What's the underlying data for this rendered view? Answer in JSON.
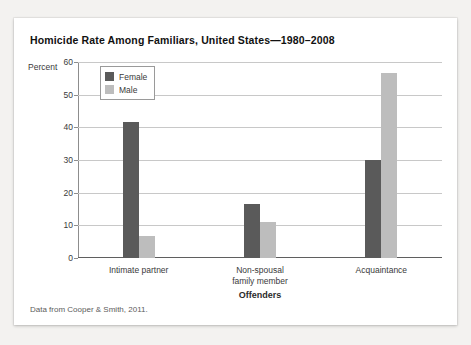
{
  "card": {
    "title": "Homicide Rate Among Familiars, United States—1980–2008",
    "source_note": "Data from Cooper & Smith, 2011."
  },
  "colors": {
    "female_bar": "#5a5a5a",
    "male_bar": "#bdbdbd",
    "gridline": "#c8c8c8",
    "axis": "#5f5f5f",
    "card_background": "#ffffff",
    "page_background": "#f3f2f0"
  },
  "legend": {
    "position": "top-left-inside-plot",
    "entries": [
      {
        "label": "Female",
        "swatch": "#5a5a5a"
      },
      {
        "label": "Male",
        "swatch": "#bdbdbd"
      }
    ]
  },
  "chart_data": {
    "type": "bar",
    "title": "Homicide Rate Among Familiars, United States—1980–2008",
    "subtitle": "",
    "xlabel": "Offenders",
    "ylabel": "Percent",
    "categories": [
      "Intimate partner",
      "Non-spousal family member",
      "Acquaintance"
    ],
    "category_lines": [
      [
        "Intimate partner"
      ],
      [
        "Non-spousal",
        "family member"
      ],
      [
        "Acquaintance"
      ]
    ],
    "series": [
      {
        "name": "Female",
        "color": "#5a5a5a",
        "values": [
          41.5,
          16.5,
          30.0
        ]
      },
      {
        "name": "Male",
        "color": "#bdbdbd",
        "values": [
          6.8,
          11.0,
          56.5
        ]
      }
    ],
    "ylim": [
      0,
      60
    ],
    "yticks": [
      0,
      10,
      20,
      30,
      40,
      50,
      60
    ],
    "ytick_labels": [
      "0",
      "10",
      "20",
      "30",
      "40",
      "50",
      "60"
    ],
    "grid": true,
    "grid_axis": "y",
    "legend_position": "upper left",
    "annotations": [
      "Data from Cooper & Smith, 2011."
    ]
  }
}
